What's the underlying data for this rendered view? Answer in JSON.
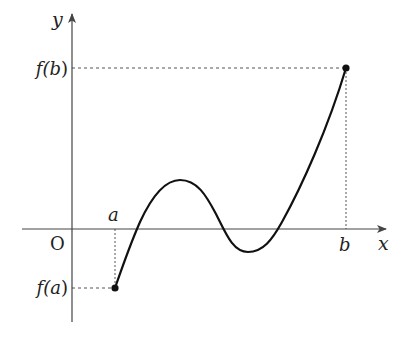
{
  "diagram": {
    "type": "function-graph",
    "labels": {
      "y_axis": "y",
      "x_axis": "x",
      "origin": "O",
      "a": "a",
      "b": "b",
      "fa_open": "f(",
      "fa_var": "a",
      "fa_close": ")",
      "fb_open": "f(",
      "fb_var": "b",
      "fb_close": ")"
    },
    "colors": {
      "axis": "#444444",
      "curve": "#111111",
      "guide": "#555555",
      "text": "#222222"
    },
    "endpoints": [
      {
        "name": "A",
        "label_x": "a",
        "label_y": "f(a)",
        "sign": "negative"
      },
      {
        "name": "B",
        "label_x": "b",
        "label_y": "f(b)",
        "sign": "positive"
      }
    ],
    "x_intercepts_count": 3
  }
}
